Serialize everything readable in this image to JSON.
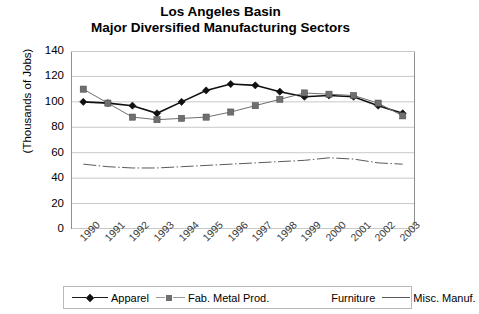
{
  "chart_data": {
    "type": "line",
    "title": "Los Angeles Basin Major Diversified Manufacturing Sectors",
    "title_lines": [
      "Los Angeles Basin",
      "Major Diversified Manufacturing Sectors"
    ],
    "xlabel": "",
    "ylabel": "(Thousands of Jobs)",
    "ylim": [
      0,
      140
    ],
    "ytick_step": 20,
    "yticks": [
      140,
      120,
      100,
      80,
      60,
      40,
      20,
      0
    ],
    "grid": true,
    "grid_axis": "y",
    "legend_position": "bottom",
    "categories": [
      "1990",
      "1991",
      "1992",
      "1993",
      "1994",
      "1995",
      "1996",
      "1997",
      "1998",
      "1999",
      "2000",
      "2001",
      "2002",
      "2003"
    ],
    "series": [
      {
        "name": "Apparel",
        "marker": "diamond",
        "color": "#101010",
        "values": [
          100,
          99,
          97,
          91,
          100,
          109,
          114,
          113,
          108,
          104,
          105,
          104,
          97,
          91
        ]
      },
      {
        "name": "Fab. Metal Prod.",
        "marker": "square",
        "color": "#6f6f6f",
        "values": [
          110,
          99,
          88,
          86,
          87,
          88,
          92,
          97,
          102,
          107,
          106,
          105,
          99,
          89
        ]
      },
      {
        "name": "Furniture",
        "marker": "none",
        "color": "#ffffff",
        "values": [
          null,
          null,
          null,
          null,
          null,
          null,
          null,
          null,
          null,
          null,
          null,
          null,
          null,
          null
        ]
      },
      {
        "name": "Misc. Manuf.",
        "marker": "none",
        "color": "#5a5a5a",
        "values": [
          51,
          49,
          48,
          48,
          49,
          50,
          51,
          52,
          53,
          54,
          56,
          55,
          52,
          51
        ]
      }
    ]
  },
  "legend": {
    "items": [
      {
        "label": "Apparel",
        "marker": "diamond-marker",
        "line": "solid-dark"
      },
      {
        "label": "Fab. Metal Prod.",
        "marker": "square-marker",
        "line": "solid-light"
      },
      {
        "label": "Furniture",
        "marker": "none",
        "line": "invisible"
      },
      {
        "label": "Misc. Manuf.",
        "marker": "none",
        "line": "dash-dot"
      }
    ]
  },
  "colors": {
    "apparel": "#101010",
    "fab_metal": "#6f6f6f",
    "misc_manuf": "#5a5a5a",
    "furniture": "#ffffff",
    "grid": "#c8c8c8",
    "axis": "#8f8f8f",
    "background": "#ffffff"
  }
}
